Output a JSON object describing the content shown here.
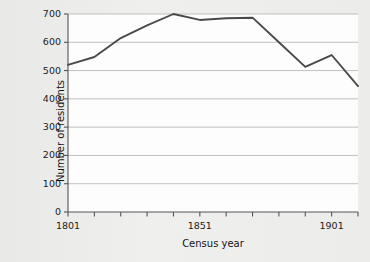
{
  "chart_data": {
    "type": "line",
    "title": "",
    "xlabel": "Census year",
    "ylabel": "Number of residents",
    "x": [
      1801,
      1811,
      1821,
      1831,
      1841,
      1851,
      1861,
      1871,
      1881,
      1891,
      1901,
      1911
    ],
    "categories": [
      "1801",
      "1811",
      "1821",
      "1831",
      "1841",
      "1851",
      "1861",
      "1871",
      "1881",
      "1891",
      "1901",
      "1911"
    ],
    "values": [
      520,
      548,
      615,
      660,
      700,
      679,
      685,
      687,
      600,
      513,
      555,
      445
    ],
    "series": [
      {
        "name": "Number of residents",
        "values": [
          520,
          548,
          615,
          660,
          700,
          679,
          685,
          687,
          600,
          513,
          555,
          445
        ]
      }
    ],
    "ylim": [
      0,
      700
    ],
    "xlim": [
      1801,
      1911
    ],
    "yticks": [
      0,
      100,
      200,
      300,
      400,
      500,
      600,
      700
    ],
    "ytick_labels": [
      "0",
      "100",
      "200",
      "300",
      "400",
      "500",
      "600",
      "700"
    ],
    "xticks": [
      1801,
      1811,
      1821,
      1831,
      1841,
      1851,
      1861,
      1871,
      1881,
      1891,
      1901,
      1911
    ],
    "xtick_labels_visible": [
      "1801",
      "1851",
      "1901"
    ],
    "xtick_label_values": [
      1801,
      1851,
      1901
    ],
    "grid": true,
    "grid_axis": "y",
    "legend": "none",
    "line_color": "#4a4a4a",
    "grid_color": "#b9b9b9",
    "axis_color": "#555555",
    "plot_bg": "#fdfdfd",
    "figure_bg": "#ececeb"
  }
}
